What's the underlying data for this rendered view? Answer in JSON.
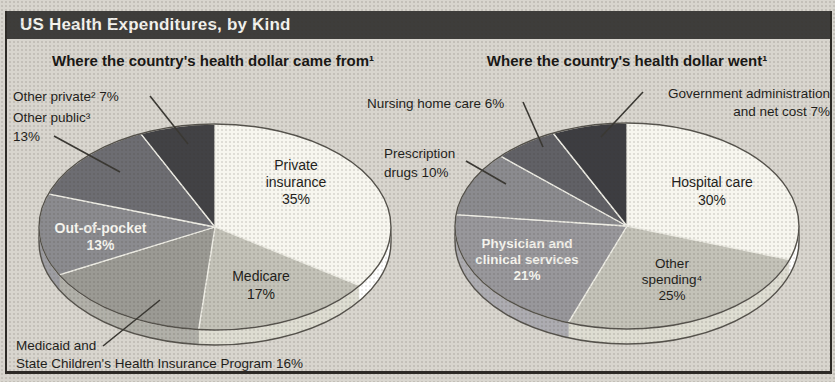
{
  "header": {
    "title": "US Health Expenditures, by Kind"
  },
  "colors": {
    "paper": "#d8d5ce",
    "title_bar": "#3e3d3b",
    "frame_border": "#2d2a26",
    "pie_outline": "#56534d",
    "slice_separator": "#edece4",
    "leader_line": "#3a3833",
    "inside_label_light": "#f5f4ee",
    "text_dark": "#1f1e1b"
  },
  "chart_data": [
    {
      "type": "pie",
      "title": "Where the country's health dollar came from¹",
      "values_unit": "%",
      "segments": [
        {
          "label": "Private insurance",
          "value": 35,
          "color": "#f7f6ef",
          "callout": "Private\ninsurance\n35%",
          "callout_style": "inside-dark"
        },
        {
          "label": "Medicare",
          "value": 17,
          "color": "#c3c2b8",
          "callout": "Medicare\n17%",
          "callout_style": "inside-dark"
        },
        {
          "label": "Medicaid and State Children's Health Insurance Program",
          "value": 16,
          "color": "#9b9a94",
          "callout": "Medicaid and\nState Children's Health Insurance Program 16%",
          "callout_style": "outside"
        },
        {
          "label": "Out-of-pocket",
          "value": 13,
          "color": "#8b8b8f",
          "callout": "Out-of-pocket\n13%",
          "callout_style": "inside-light"
        },
        {
          "label": "Other public",
          "value": 13,
          "color": "#6d6d72",
          "callout": "Other public³\n13%",
          "callout_style": "outside"
        },
        {
          "label": "Other private",
          "value": 7,
          "color": "#424245",
          "callout": "Other private² 7%",
          "callout_style": "outside"
        }
      ]
    },
    {
      "type": "pie",
      "title": "Where the country's health dollar went¹",
      "values_unit": "%",
      "segments": [
        {
          "label": "Hospital care",
          "value": 30,
          "color": "#f7f6ef",
          "callout": "Hospital care\n30%",
          "callout_style": "inside-dark"
        },
        {
          "label": "Other spending",
          "value": 25,
          "color": "#c3c2b8",
          "callout": "Other\nspending⁴\n25%",
          "callout_style": "inside-dark"
        },
        {
          "label": "Physician and clinical services",
          "value": 21,
          "color": "#98979b",
          "callout": "Physician and\nclinical services\n21%",
          "callout_style": "inside-light"
        },
        {
          "label": "Prescription drugs",
          "value": 10,
          "color": "#8b8b8f",
          "callout": "Prescription\ndrugs 10%",
          "callout_style": "outside"
        },
        {
          "label": "Nursing home care",
          "value": 6,
          "color": "#616166",
          "callout": "Nursing home care 6%",
          "callout_style": "outside"
        },
        {
          "label": "Government administration and net cost",
          "value": 7,
          "color": "#3d3d41",
          "callout": "Government administration\nand net cost 7%",
          "callout_style": "outside"
        }
      ]
    }
  ]
}
